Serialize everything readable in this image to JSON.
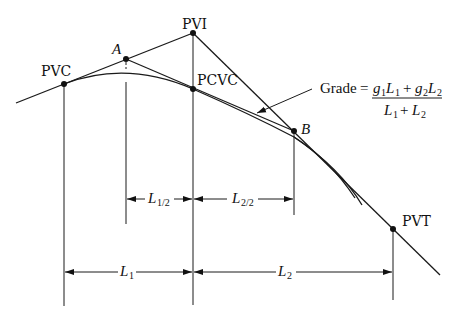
{
  "diagram": {
    "points": {
      "pvc": {
        "label": "PVC",
        "x": 64,
        "y": 84
      },
      "a": {
        "label": "A",
        "x": 126,
        "y": 59
      },
      "pvi": {
        "label": "PVI",
        "x": 193,
        "y": 33
      },
      "pcvc": {
        "label": "PCVC",
        "x": 193,
        "y": 89
      },
      "b": {
        "label": "B",
        "x": 294,
        "y": 131
      },
      "pvt": {
        "label": "PVT",
        "x": 393,
        "y": 229
      }
    },
    "formula": {
      "lhs": "Grade",
      "equals": "=",
      "numerator": {
        "t1_g": "g",
        "t1_gsub": "1",
        "t1_L": "L",
        "t1_Lsub": "1",
        "plus": "+",
        "t2_g": "g",
        "t2_gsub": "2",
        "t2_L": "L",
        "t2_Lsub": "2"
      },
      "denominator": {
        "L1": "L",
        "L1sub": "1",
        "plus": "+",
        "L2": "L",
        "L2sub": "2"
      }
    },
    "dimensions": {
      "half1": {
        "main": "L",
        "sub": "1/2"
      },
      "half2": {
        "main": "L",
        "sub": "2/2"
      },
      "full1": {
        "main": "L",
        "sub": "1"
      },
      "full2": {
        "main": "L",
        "sub": "2"
      }
    }
  }
}
